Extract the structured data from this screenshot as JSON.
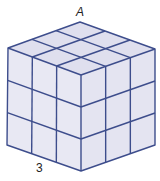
{
  "diagram": {
    "type": "isometric-cube",
    "grid_size": 3,
    "labels": {
      "top_vertex": "A",
      "edge": "3"
    },
    "colors": {
      "line": "#3d4d8c",
      "top_face": "#dfdfee",
      "left_face": "#e8e8f3",
      "right_face": "#e4e4f1"
    }
  }
}
